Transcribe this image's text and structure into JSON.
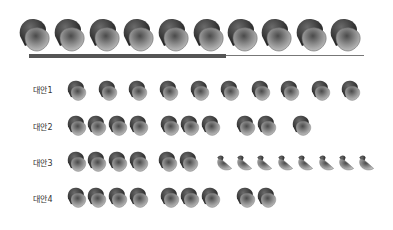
{
  "top_row": {
    "count": 10,
    "xs": [
      17,
      52,
      87,
      121,
      156,
      191,
      225,
      259,
      294,
      328
    ],
    "y": 16,
    "w": 34,
    "h": 36
  },
  "progress": {
    "thick_end": 226,
    "thin_end": 364
  },
  "rows": [
    {
      "label": "대안1",
      "label_y": 84,
      "y": 79,
      "full": [
        66,
        97,
        127,
        158,
        189,
        219,
        250,
        279,
        310,
        340
      ],
      "half": []
    },
    {
      "label": "대안2",
      "label_y": 121,
      "y": 114,
      "full": [
        66,
        86,
        107,
        128,
        159,
        179,
        200,
        235,
        256,
        291
      ],
      "half": []
    },
    {
      "label": "대안3",
      "label_y": 157,
      "y": 150,
      "full": [
        66,
        86,
        107,
        128,
        157,
        178
      ],
      "half": [
        215,
        235,
        255,
        276,
        296,
        317,
        337,
        357
      ]
    },
    {
      "label": "대안4",
      "label_y": 193,
      "y": 186,
      "full": [
        66,
        86,
        107,
        128,
        159,
        179,
        200,
        235,
        256
      ],
      "half": []
    }
  ],
  "colors": {
    "dark": "#2f2f2f",
    "mid": "#5a5a5a",
    "light": "#9a9a9a",
    "bar": "#555555"
  }
}
